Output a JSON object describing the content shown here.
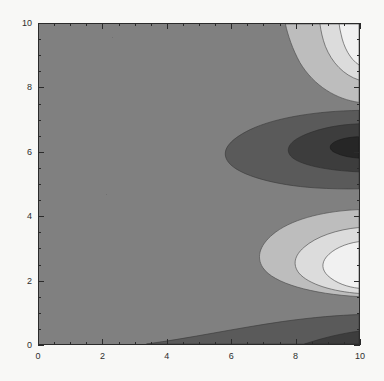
{
  "figure": {
    "name": "contour-density-plot",
    "background_color": "#f8f8f6",
    "frame_color": "#2b2b2b"
  },
  "chart_data": {
    "type": "heatmap",
    "render_style": "filled-contour",
    "title": "",
    "subtitle": "",
    "xlabel": "",
    "ylabel": "",
    "xlim": [
      0,
      10
    ],
    "ylim": [
      0,
      10
    ],
    "grid": false,
    "legend": null,
    "colormap": "grayscale",
    "x_ticks": [
      0,
      2,
      4,
      6,
      8,
      10
    ],
    "x_tick_labels": [
      "0",
      "2",
      "4",
      "6",
      "8",
      "10"
    ],
    "x_minor_tick_step": 0.5,
    "y_ticks": [
      0,
      2,
      4,
      6,
      8,
      10
    ],
    "y_tick_labels": [
      "0",
      "2",
      "4",
      "6",
      "8",
      "10"
    ],
    "y_minor_tick_step": 0.5,
    "contour_levels": [
      {
        "index": 0,
        "label": "darkest",
        "color": "#262626"
      },
      {
        "index": 1,
        "label": "very-dark",
        "color": "#3d3d3d"
      },
      {
        "index": 2,
        "label": "dark",
        "color": "#5a5a5a"
      },
      {
        "index": 3,
        "label": "base-mid",
        "color": "#808080"
      },
      {
        "index": 4,
        "label": "light",
        "color": "#bdbdbd"
      },
      {
        "index": 5,
        "label": "very-light",
        "color": "#dcdcdc"
      },
      {
        "index": 6,
        "label": "lightest",
        "color": "#f1f1f1"
      }
    ],
    "features": [
      {
        "name": "dark-minimum-core",
        "x": 10.0,
        "y": 6.2,
        "level": "darkest"
      },
      {
        "name": "dark-lobe",
        "x": 9.4,
        "y": 6.2,
        "level": "very-dark"
      },
      {
        "name": "dark-band",
        "x": 7.6,
        "y": 6.2,
        "level": "dark"
      },
      {
        "name": "bright-maximum-lower",
        "x": 10.0,
        "y": 2.4,
        "level": "lightest"
      },
      {
        "name": "bright-maximum-upper",
        "x": 10.0,
        "y": 9.7,
        "level": "lightest"
      },
      {
        "name": "dark-band-bottom-edge",
        "x": 3.4,
        "y": 0.0,
        "level": "dark"
      }
    ]
  }
}
